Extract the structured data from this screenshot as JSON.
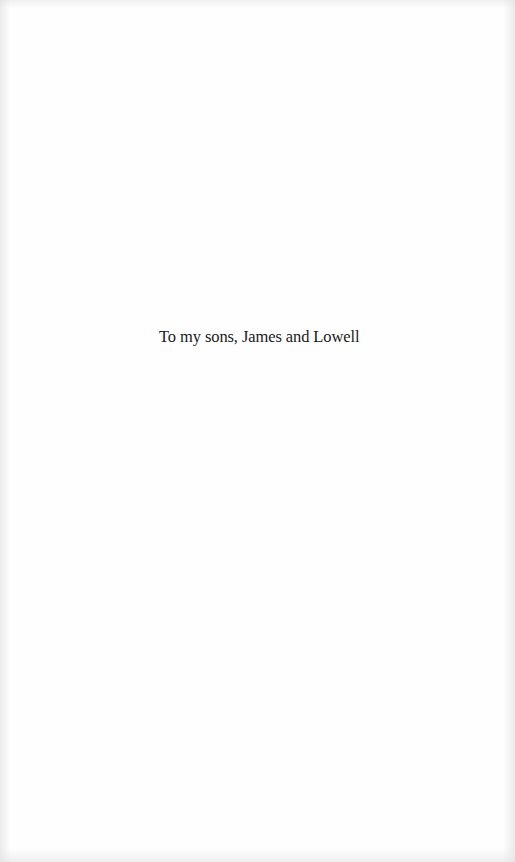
{
  "page": {
    "type": "dedication",
    "text": "To my sons, James and Lowell"
  },
  "colors": {
    "background": "#fefefe",
    "text": "#1a1a1a"
  }
}
